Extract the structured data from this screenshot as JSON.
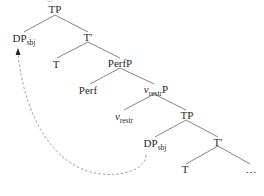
{
  "diagram": {
    "type": "syntax-tree",
    "nodes": {
      "tp_root": {
        "label": "TP"
      },
      "dp_sbj_top": {
        "label": "DP",
        "sub": "sbj"
      },
      "tbar_top": {
        "label": "T′"
      },
      "t_top": {
        "label": "T"
      },
      "perfp": {
        "label": "PerfP"
      },
      "perf": {
        "label": "Perf"
      },
      "vrestr_p": {
        "label_v": "v",
        "sub": "restr",
        "suffix": "P"
      },
      "vrestr": {
        "label_v": "v",
        "sub": "restr"
      },
      "tp_low": {
        "label": "TP"
      },
      "dp_sbj_low": {
        "label": "DP",
        "sub": "sbj"
      },
      "tbar_low": {
        "label": "T′"
      },
      "t_low": {
        "label": "T"
      },
      "ellipsis": {
        "label": "…"
      }
    },
    "edges": [
      [
        "tp_root",
        "dp_sbj_top"
      ],
      [
        "tp_root",
        "tbar_top"
      ],
      [
        "tbar_top",
        "t_top"
      ],
      [
        "tbar_top",
        "perfp"
      ],
      [
        "perfp",
        "perf"
      ],
      [
        "perfp",
        "vrestr_p"
      ],
      [
        "vrestr_p",
        "vrestr"
      ],
      [
        "vrestr_p",
        "tp_low"
      ],
      [
        "tp_low",
        "dp_sbj_low"
      ],
      [
        "tp_low",
        "tbar_low"
      ],
      [
        "tbar_low",
        "t_low"
      ],
      [
        "tbar_low",
        "ellipsis"
      ]
    ],
    "movement_arrow": {
      "from": "dp_sbj_low",
      "to": "dp_sbj_top",
      "style": "dashed"
    },
    "colors": {
      "line": "#555555",
      "text": "#2a2a2a",
      "arrow": "#777777"
    }
  }
}
